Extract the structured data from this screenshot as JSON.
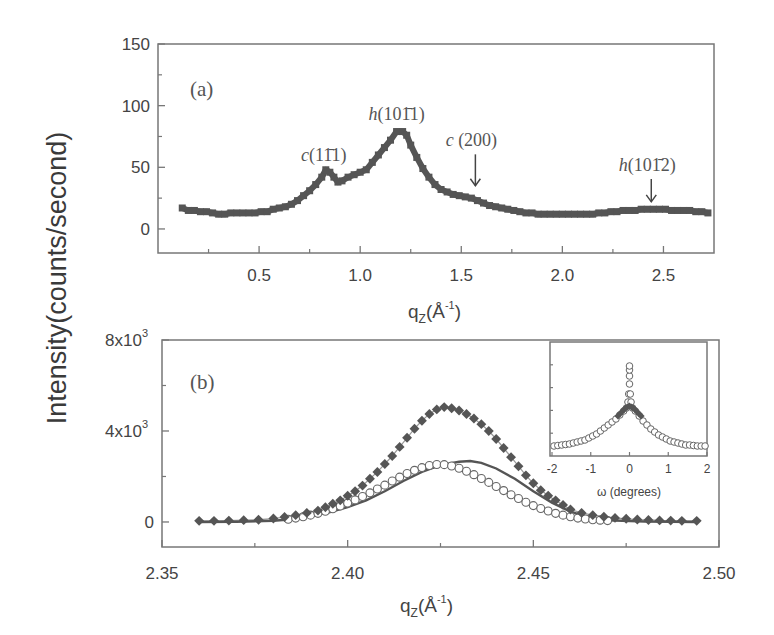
{
  "figure": {
    "ylabel": "Intensity(counts/second)"
  },
  "chart_data": [
    {
      "id": "a",
      "type": "scatter",
      "panel_label": "(a)",
      "title": "",
      "xlabel": "q_Z(Å^-1)",
      "ylabel": "Intensity(counts/second)",
      "xlim": [
        0.0,
        2.75
      ],
      "ylim": [
        -19.5,
        150
      ],
      "xticks": [
        0.5,
        1.0,
        1.5,
        2.0,
        2.5
      ],
      "xtick_labels": [
        "0.5",
        "1.0",
        "1.5",
        "2.0",
        "2.5"
      ],
      "xminor": [
        0.25,
        0.75,
        1.25,
        1.75,
        2.25
      ],
      "yticks": [
        0,
        50,
        100,
        150
      ],
      "ytick_labels": [
        "0",
        "50",
        "100",
        "150"
      ],
      "yminor": [
        25,
        75,
        125
      ],
      "grid": false,
      "marker_color": "#555555",
      "series": [
        {
          "name": "measured",
          "marker": "filled-square",
          "x": [
            0.12,
            0.15,
            0.18,
            0.21,
            0.24,
            0.27,
            0.3,
            0.33,
            0.36,
            0.39,
            0.42,
            0.45,
            0.48,
            0.51,
            0.54,
            0.57,
            0.6,
            0.63,
            0.66,
            0.69,
            0.72,
            0.75,
            0.78,
            0.81,
            0.83,
            0.85,
            0.87,
            0.89,
            0.91,
            0.94,
            0.97,
            1.0,
            1.03,
            1.06,
            1.09,
            1.12,
            1.15,
            1.18,
            1.21,
            1.23,
            1.25,
            1.28,
            1.31,
            1.34,
            1.37,
            1.4,
            1.43,
            1.46,
            1.49,
            1.52,
            1.55,
            1.58,
            1.61,
            1.64,
            1.67,
            1.7,
            1.73,
            1.76,
            1.79,
            1.82,
            1.85,
            1.88,
            1.91,
            1.94,
            1.97,
            2.0,
            2.03,
            2.06,
            2.09,
            2.12,
            2.15,
            2.18,
            2.21,
            2.24,
            2.27,
            2.3,
            2.33,
            2.36,
            2.39,
            2.42,
            2.45,
            2.48,
            2.51,
            2.54,
            2.57,
            2.6,
            2.63,
            2.66,
            2.69,
            2.72
          ],
          "y": [
            17,
            15,
            15,
            14,
            14,
            13,
            12,
            12,
            13,
            13,
            13,
            13,
            13,
            14,
            14,
            16,
            17,
            18,
            20,
            23,
            27,
            31,
            36,
            42,
            48,
            46,
            42,
            38,
            39,
            42,
            44,
            46,
            48,
            54,
            60,
            66,
            72,
            79,
            79,
            76,
            68,
            58,
            49,
            42,
            36,
            32,
            30,
            28,
            27,
            26,
            25,
            23,
            21,
            19,
            18,
            17,
            16,
            15,
            14,
            13,
            13,
            12,
            12,
            12,
            12,
            12,
            12,
            12,
            12,
            12,
            12,
            13,
            13,
            14,
            14,
            15,
            15,
            15,
            16,
            16,
            16,
            16,
            16,
            15,
            15,
            15,
            15,
            14,
            14,
            13
          ]
        }
      ],
      "annotations": [
        {
          "text": "c(11̄1̄)",
          "label_italic": "c",
          "label_rest": "(11̄1)",
          "x": 0.82,
          "y": 55,
          "arrow": false
        },
        {
          "text": "h(101̄1)",
          "label_italic": "h",
          "label_rest": "(101̄1)",
          "x": 1.18,
          "y": 88,
          "arrow": false
        },
        {
          "text": "c(200)",
          "label_italic": "c",
          "label_rest": " (200)",
          "x": 1.55,
          "y": 67,
          "arrow": true,
          "arrow_to": 35
        },
        {
          "text": "h(101̄2)",
          "label_italic": "h",
          "label_rest": "(101̄2)",
          "x": 2.42,
          "y": 47,
          "arrow": true,
          "arrow_to": 22
        }
      ]
    },
    {
      "id": "b",
      "type": "scatter",
      "panel_label": "(b)",
      "title": "",
      "xlabel": "q_Z(Å^-1)",
      "ylabel": "Intensity(counts/second)",
      "xlim": [
        2.35,
        2.5
      ],
      "ylim": [
        -1100,
        8000
      ],
      "xticks": [
        2.35,
        2.4,
        2.45,
        2.5
      ],
      "xtick_labels": [
        "2.35",
        "2.40",
        "2.45",
        "2.50"
      ],
      "xminor": [
        2.375,
        2.425,
        2.475
      ],
      "yticks": [
        0,
        4000,
        8000
      ],
      "ytick_labels": [
        "0",
        "4x10³",
        "8x10³"
      ],
      "ytick_base": [
        "0",
        "4x10",
        "8x10"
      ],
      "ytick_exp": [
        "",
        "3",
        "3"
      ],
      "yminor": [
        2000,
        6000
      ],
      "grid": false,
      "series": [
        {
          "name": "filled squares",
          "marker": "filled-square",
          "color": "#555555",
          "x": [
            2.36,
            2.364,
            2.368,
            2.372,
            2.376,
            2.38,
            2.383,
            2.386,
            2.389,
            2.392,
            2.394,
            2.396,
            2.398,
            2.4,
            2.402,
            2.404,
            2.406,
            2.408,
            2.41,
            2.412,
            2.414,
            2.416,
            2.418,
            2.42,
            2.422,
            2.424,
            2.426,
            2.428,
            2.43,
            2.432,
            2.434,
            2.436,
            2.438,
            2.44,
            2.442,
            2.444,
            2.446,
            2.448,
            2.45,
            2.452,
            2.454,
            2.456,
            2.458,
            2.46,
            2.463,
            2.466,
            2.469,
            2.472,
            2.475,
            2.478,
            2.481,
            2.484,
            2.487,
            2.49,
            2.494
          ],
          "y": [
            50,
            50,
            60,
            80,
            100,
            150,
            220,
            300,
            400,
            500,
            650,
            800,
            950,
            1150,
            1350,
            1600,
            1900,
            2200,
            2550,
            2900,
            3300,
            3700,
            4100,
            4450,
            4750,
            4950,
            5050,
            5000,
            4900,
            4750,
            4550,
            4300,
            4000,
            3650,
            3250,
            2850,
            2450,
            2050,
            1700,
            1400,
            1150,
            950,
            750,
            550,
            400,
            300,
            230,
            180,
            140,
            110,
            90,
            70,
            60,
            50,
            50
          ]
        },
        {
          "name": "open circles",
          "marker": "open-circle",
          "color": "#666666",
          "x": [
            2.384,
            2.386,
            2.388,
            2.39,
            2.392,
            2.394,
            2.396,
            2.398,
            2.4,
            2.402,
            2.404,
            2.406,
            2.408,
            2.41,
            2.412,
            2.414,
            2.416,
            2.418,
            2.42,
            2.422,
            2.424,
            2.426,
            2.428,
            2.43,
            2.432,
            2.434,
            2.436,
            2.438,
            2.44,
            2.442,
            2.444,
            2.446,
            2.448,
            2.45,
            2.452,
            2.454,
            2.456,
            2.458,
            2.46,
            2.462,
            2.464,
            2.466,
            2.468,
            2.47
          ],
          "y": [
            120,
            170,
            230,
            300,
            380,
            470,
            580,
            700,
            830,
            970,
            1120,
            1280,
            1450,
            1620,
            1800,
            1970,
            2130,
            2270,
            2390,
            2480,
            2530,
            2520,
            2460,
            2360,
            2230,
            2080,
            1910,
            1740,
            1560,
            1380,
            1200,
            1030,
            870,
            720,
            590,
            480,
            380,
            300,
            230,
            170,
            130,
            100,
            80,
            60
          ]
        },
        {
          "name": "solid line (fit)",
          "marker": "line",
          "color": "#555555",
          "x": [
            2.36,
            2.37,
            2.38,
            2.385,
            2.39,
            2.395,
            2.4,
            2.405,
            2.41,
            2.415,
            2.42,
            2.425,
            2.43,
            2.433,
            2.436,
            2.44,
            2.445,
            2.45,
            2.455,
            2.46,
            2.465,
            2.47,
            2.48,
            2.494
          ],
          "y": [
            0,
            10,
            50,
            120,
            250,
            420,
            650,
            950,
            1350,
            1800,
            2200,
            2500,
            2650,
            2680,
            2600,
            2350,
            1900,
            1350,
            850,
            450,
            200,
            80,
            20,
            0
          ]
        }
      ],
      "inset": {
        "type": "scatter",
        "xlabel": "ω (degrees)",
        "xlim": [
          -2,
          2
        ],
        "xticks": [
          -2,
          -1,
          0,
          1,
          2
        ],
        "xtick_labels": [
          "-2",
          "-1",
          "0",
          "1",
          "2"
        ],
        "ylim": [
          0,
          1
        ],
        "yticks_count": 5,
        "series": [
          {
            "name": "open circles",
            "marker": "open-circle",
            "x": [
              -1.95,
              -1.85,
              -1.75,
              -1.65,
              -1.55,
              -1.45,
              -1.35,
              -1.25,
              -1.15,
              -1.05,
              -0.95,
              -0.85,
              -0.75,
              -0.65,
              -0.55,
              -0.45,
              -0.35,
              -0.25,
              -0.15,
              -0.08,
              -0.04,
              -0.02,
              0.0,
              0.0,
              0.0,
              0.0,
              0.02,
              0.04,
              0.08,
              0.15,
              0.25,
              0.35,
              0.45,
              0.55,
              0.65,
              0.75,
              0.85,
              0.95,
              1.05,
              1.15,
              1.25,
              1.35,
              1.45,
              1.55,
              1.65,
              1.75,
              1.85,
              1.95
            ],
            "y": [
              0.06,
              0.065,
              0.07,
              0.075,
              0.08,
              0.09,
              0.1,
              0.11,
              0.12,
              0.14,
              0.16,
              0.18,
              0.21,
              0.24,
              0.27,
              0.3,
              0.33,
              0.37,
              0.41,
              0.44,
              0.5,
              0.58,
              0.68,
              0.76,
              0.82,
              0.86,
              0.58,
              0.5,
              0.44,
              0.41,
              0.36,
              0.31,
              0.27,
              0.23,
              0.2,
              0.17,
              0.15,
              0.13,
              0.11,
              0.1,
              0.09,
              0.08,
              0.07,
              0.07,
              0.065,
              0.06,
              0.06,
              0.06
            ]
          },
          {
            "name": "filled squares",
            "marker": "filled-square",
            "x": [
              -0.3,
              -0.25,
              -0.2,
              -0.15,
              -0.1,
              -0.05,
              0.0,
              0.05,
              0.1,
              0.15,
              0.2,
              0.25,
              0.3
            ],
            "y": [
              0.36,
              0.38,
              0.4,
              0.42,
              0.44,
              0.45,
              0.46,
              0.45,
              0.44,
              0.42,
              0.4,
              0.38,
              0.36
            ]
          }
        ]
      }
    }
  ]
}
